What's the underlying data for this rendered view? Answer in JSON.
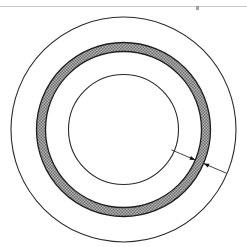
{
  "figure": {
    "kind": "engineering-diagram",
    "canvas": {
      "width": 247,
      "height": 247,
      "background_color": "#ffffff"
    },
    "center": {
      "x": 123.5,
      "y": 129.5
    },
    "circles": [
      {
        "name": "outer-boundary-circle",
        "radius": 112.5,
        "stroke_color": "#2b2b2b",
        "stroke_width": 1.1,
        "fill": "none"
      },
      {
        "name": "ring-outer-edge-circle",
        "radius": 87,
        "stroke_color": "#1e1e1e",
        "stroke_width": 1.3,
        "fill": "none"
      },
      {
        "name": "ring-inner-edge-circle",
        "radius": 78,
        "stroke_color": "#1e1e1e",
        "stroke_width": 1.3,
        "fill": "none"
      },
      {
        "name": "inner-bore-circle",
        "radius": 55,
        "stroke_color": "#2b2b2b",
        "stroke_width": 1.1,
        "fill": "none"
      }
    ],
    "shaded_ring": {
      "name": "shaded-annulus",
      "outer_radius": 87,
      "inner_radius": 78,
      "thickness": 9,
      "fill_color": "#9a9a9a",
      "fill_pattern": "fine-checker-stipple",
      "pattern_dark": "#6e6e6e",
      "pattern_light": "#c8c8c8"
    },
    "dimension": {
      "name": "ring-thickness-dimension",
      "label": "",
      "angle_degrees": 23,
      "line_color": "#303030",
      "line_width": 0.9,
      "arrowhead_color": "#101010",
      "inner_extension_start_radius": 52,
      "outer_extension_end_radius": 112,
      "arrow_inner_radius": 78,
      "arrow_outer_radius": 87
    },
    "artifacts": [
      {
        "name": "scan-line-artifact",
        "type": "horizontal-line",
        "x": 0,
        "y": 6,
        "width": 247,
        "height": 1,
        "color": "#b4b4b4"
      },
      {
        "name": "scan-speck-artifact",
        "type": "speck",
        "x": 196,
        "y": 6,
        "width": 3,
        "height": 4,
        "color": "#8c8c8c"
      }
    ]
  }
}
